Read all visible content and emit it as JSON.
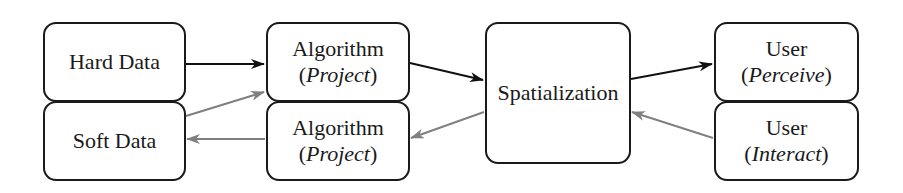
{
  "diagram": {
    "nodes": {
      "hard_data": {
        "label": "Hard Data"
      },
      "soft_data": {
        "label": "Soft Data"
      },
      "algorithm_top": {
        "label": "Algorithm",
        "sub_open": "(",
        "sub_italic": "Project",
        "sub_close": ")"
      },
      "algorithm_bottom": {
        "label": "Algorithm",
        "sub_open": "(",
        "sub_italic": "Project",
        "sub_close": ")"
      },
      "spatialization": {
        "label": "Spatialization"
      },
      "user_perceive": {
        "label": "User",
        "sub_open": "(",
        "sub_italic": "Perceive",
        "sub_close": ")"
      },
      "user_interact": {
        "label": "User",
        "sub_open": "(",
        "sub_italic": "Interact",
        "sub_close": ")"
      }
    },
    "edges": [
      {
        "from": "hard_data",
        "to": "algorithm_top",
        "style": "forward",
        "color": "#111111"
      },
      {
        "from": "algorithm_top",
        "to": "spatialization",
        "style": "forward",
        "color": "#111111"
      },
      {
        "from": "spatialization",
        "to": "user_perceive",
        "style": "forward",
        "color": "#111111"
      },
      {
        "from": "user_interact",
        "to": "spatialization",
        "style": "feedback",
        "color": "#808080"
      },
      {
        "from": "spatialization",
        "to": "algorithm_bottom",
        "style": "feedback",
        "color": "#808080"
      },
      {
        "from": "algorithm_bottom",
        "to": "soft_data",
        "style": "feedback",
        "color": "#808080"
      },
      {
        "from": "soft_data",
        "to": "algorithm_top",
        "style": "feedback",
        "color": "#808080"
      }
    ],
    "colors": {
      "forward": "#111111",
      "feedback": "#808080",
      "border": "#1a1a1a"
    }
  }
}
